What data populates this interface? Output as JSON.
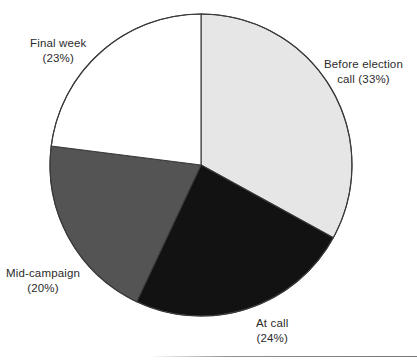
{
  "chart_data": {
    "type": "pie",
    "title": "",
    "subtitle": "",
    "xlabel": "",
    "ylabel": "",
    "legend_position": "none",
    "grid": false,
    "units": "percent",
    "total": 100,
    "start_angle_deg": 0,
    "direction": "clockwise",
    "categories": [
      "Before election call",
      "At call",
      "Mid-campaign",
      "Final week"
    ],
    "values": [
      33,
      24,
      20,
      23
    ],
    "slices": [
      {
        "name": "Before election call",
        "value": 33,
        "value_text": "(33%)",
        "color": "#e6e6e6",
        "label_line1": "Before election",
        "label_line2": "call (33%)"
      },
      {
        "name": "At call",
        "value": 24,
        "value_text": "(24%)",
        "color": "#121212",
        "label_line1": "At call",
        "label_line2": "(24%)"
      },
      {
        "name": "Mid-campaign",
        "value": 20,
        "value_text": "(20%)",
        "color": "#545454",
        "label_line1": "Mid-campaign",
        "label_line2": "(20%)"
      },
      {
        "name": "Final week",
        "value": 23,
        "value_text": "(23%)",
        "color": "#ffffff",
        "label_line1": "Final week",
        "label_line2": "(23%)"
      }
    ],
    "geometry": {
      "center_x": 201,
      "center_y": 165,
      "radius": 151,
      "stroke_color": "#3a3a3a",
      "stroke_width": 1.1
    }
  },
  "figure": {
    "background_color": "#ffffff",
    "text_color": "#2b2b2b",
    "footer_rule_visible": true
  }
}
